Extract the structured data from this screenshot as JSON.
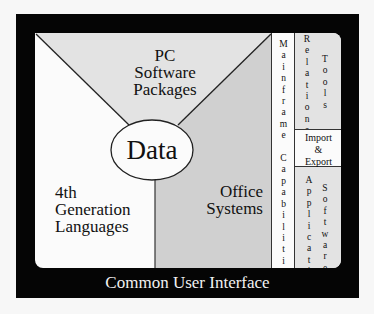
{
  "diagram": {
    "center": {
      "label": "Data"
    },
    "segments": [
      {
        "id": "pc",
        "label_lines": [
          "PC",
          "Software",
          "Packages"
        ],
        "fill": "#e3e3e3"
      },
      {
        "id": "4gl",
        "label_lines": [
          "4th",
          "Generation",
          "Languages"
        ],
        "fill": "#fbfbfb"
      },
      {
        "id": "office",
        "label_lines": [
          "Office",
          "Systems"
        ],
        "fill": "#d0d0d0"
      }
    ],
    "columns": {
      "mainframe": {
        "label": "Mainframe Capabilities",
        "words": [
          "Mainframe",
          "Capabilities"
        ],
        "fill": "#fbfbfb"
      },
      "relational_tools": {
        "words": [
          "Relational",
          "Tools"
        ],
        "fill": "#e3e3e3"
      },
      "import_export": {
        "label_lines": [
          "Import",
          "&",
          "Export"
        ],
        "fill": "#fbfbfb"
      },
      "application_software": {
        "words": [
          "Application",
          "Software"
        ],
        "fill": "#e3e3e3"
      }
    },
    "footer": {
      "label": "Common User Interface"
    },
    "colors": {
      "frame": "#050505",
      "light_gray": "#e3e3e3",
      "mid_gray": "#d0d0d0",
      "white": "#fbfbfb"
    }
  }
}
